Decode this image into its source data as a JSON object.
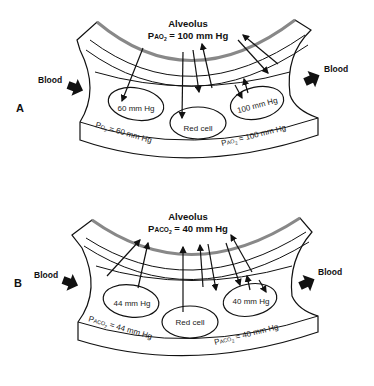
{
  "panels": [
    {
      "label": "A",
      "alveolus_title": "Alveolus",
      "alveolus_pressure_prefix": "P",
      "alveolus_pressure_sub": "AO",
      "alveolus_pressure_subscript": "2",
      "alveolus_pressure_value": " = 100 mm Hg",
      "blood_in_label": "Blood",
      "blood_out_label": "Blood",
      "left_cell_value": "60 mm Hg",
      "middle_cell_label": "Red cell",
      "right_cell_value": "100 mm Hg",
      "left_plasma_prefix": "P",
      "left_plasma_sub": "O",
      "left_plasma_subscript": "2",
      "left_plasma_value": " = 60 mm Hg",
      "right_plasma_prefix": "P",
      "right_plasma_sub": "AO",
      "right_plasma_subscript": "2",
      "right_plasma_value": " = 100 mm Hg"
    },
    {
      "label": "B",
      "alveolus_title": "Alveolus",
      "alveolus_pressure_prefix": "P",
      "alveolus_pressure_sub": "ACO",
      "alveolus_pressure_subscript": "2",
      "alveolus_pressure_value": " = 40 mm Hg",
      "blood_in_label": "Blood",
      "blood_out_label": "Blood",
      "left_cell_value": "44 mm Hg",
      "middle_cell_label": "Red cell",
      "right_cell_value": "40 mm Hg",
      "left_plasma_prefix": "P",
      "left_plasma_sub": "ACO",
      "left_plasma_subscript": "2",
      "left_plasma_value": " = 44 mm Hg",
      "right_plasma_prefix": "P",
      "right_plasma_sub": "ACO",
      "right_plasma_subscript": "2",
      "right_plasma_value": " = 40 mm Hg"
    }
  ],
  "colors": {
    "ink": "#111111",
    "shading": "#9a9a9a",
    "blood_arrow": "#111111"
  }
}
